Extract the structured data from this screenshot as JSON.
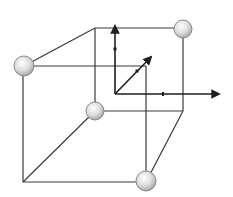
{
  "diagram": {
    "type": "unit-cell",
    "colors": {
      "background": "#ffffff",
      "edge": "#3a3a3a",
      "axis": "#1e1e1e",
      "atom_fill_light": "#ffffff",
      "atom_fill_dark": "#b8b8b8",
      "atom_stroke": "#8a8a8a"
    },
    "atoms": [
      {
        "id": "front-top-left",
        "x": 24,
        "y": 66,
        "r": 10
      },
      {
        "id": "back-top-right",
        "x": 183,
        "y": 29,
        "r": 9
      },
      {
        "id": "back-bottom-left",
        "x": 95,
        "y": 111,
        "r": 9
      },
      {
        "id": "front-bottom-right",
        "x": 146,
        "y": 181,
        "r": 10
      }
    ],
    "axes": {
      "origin": [
        115,
        94
      ],
      "labels": []
    }
  }
}
